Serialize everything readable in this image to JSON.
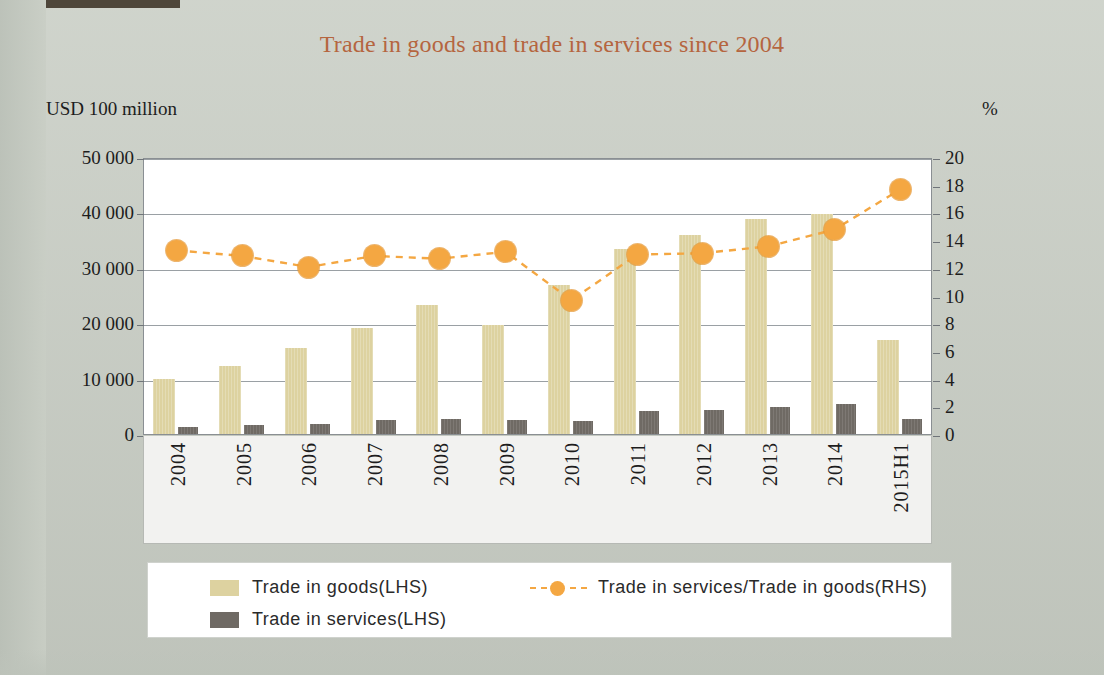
{
  "chart_data": {
    "type": "bar",
    "title": "Trade in goods and trade in services since 2004",
    "categories": [
      "2004",
      "2005",
      "2006",
      "2007",
      "2008",
      "2009",
      "2010",
      "2011",
      "2012",
      "2013",
      "2014",
      "2015H1"
    ],
    "series": [
      {
        "name": "Trade in goods (LHS)",
        "axis": "left",
        "type": "bar",
        "color": "#ddd2a0",
        "values": [
          10000,
          12300,
          15600,
          19200,
          23200,
          19700,
          26900,
          33400,
          35900,
          38800,
          39800,
          16900
        ]
      },
      {
        "name": "Trade in services (LHS)",
        "axis": "left",
        "type": "bar",
        "color": "#6f6a64",
        "values": [
          1350,
          1550,
          1850,
          2450,
          2800,
          2550,
          2350,
          4100,
          4400,
          4800,
          5500,
          2700
        ]
      },
      {
        "name": "Trade in services/Trade in goods (RHS)",
        "axis": "right",
        "type": "line",
        "color": "#f4a742",
        "values": [
          13.4,
          13.0,
          12.2,
          13.0,
          12.8,
          13.3,
          9.8,
          13.1,
          13.2,
          13.7,
          14.9,
          17.8
        ]
      }
    ],
    "left_axis": {
      "label": "USD 100 million",
      "ticks": [
        "0",
        "10 000",
        "20 000",
        "30 000",
        "40 000",
        "50 000"
      ],
      "tick_values": [
        0,
        10000,
        20000,
        30000,
        40000,
        50000
      ],
      "min": 0,
      "max": 50000
    },
    "right_axis": {
      "label": "%",
      "ticks": [
        "0",
        "2",
        "4",
        "6",
        "8",
        "10",
        "12",
        "14",
        "16",
        "18",
        "20"
      ],
      "tick_values": [
        0,
        2,
        4,
        6,
        8,
        10,
        12,
        14,
        16,
        18,
        20
      ],
      "min": 0,
      "max": 20
    },
    "xlabel": "",
    "grid": true,
    "legend_position": "bottom",
    "title_color": "#b5653f"
  },
  "legend": {
    "items": [
      {
        "label": "Trade in goods(LHS)",
        "marker": "swatch-tan"
      },
      {
        "label": "Trade in services(LHS)",
        "marker": "swatch-gray"
      },
      {
        "label": "Trade in services/Trade in goods(RHS)",
        "marker": "dashed-line-orange-dot"
      }
    ]
  }
}
